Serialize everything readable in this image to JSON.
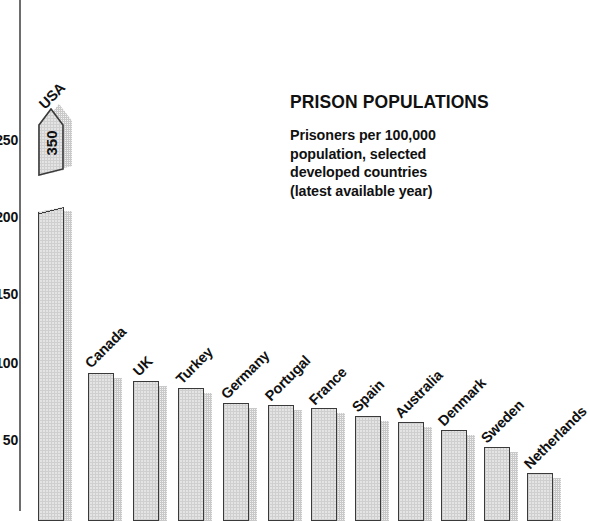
{
  "chart_data": {
    "type": "bar",
    "title": "PRISON POPULATIONS",
    "subtitle_lines": [
      "Prisoners per 100,000",
      "population, selected",
      "developed countries",
      "(latest available year)"
    ],
    "xlabel": "",
    "ylabel": "",
    "ylim": [
      0,
      260
    ],
    "grid": false,
    "legend": null,
    "y_ticks": [
      50,
      100,
      150,
      200,
      250
    ],
    "categories": [
      "USA",
      "Canada",
      "UK",
      "Turkey",
      "Germany",
      "Portugal",
      "France",
      "Spain",
      "Australia",
      "Denmark",
      "Sweden",
      "Netherlands"
    ],
    "values": [
      350,
      100,
      95,
      90,
      80,
      79,
      77,
      72,
      68,
      63,
      52,
      35
    ],
    "broken_axis_bar": {
      "category": "USA",
      "value": 350,
      "data_label": "350",
      "note": "bar is drawn broken with a pointed cap; true value exceeds axis maximum"
    },
    "style": {
      "bar_fill": "#e4e4e4",
      "bar_outline": "#3a3a3a",
      "bar_shadow": "#f2f2f2",
      "axis_color": "#6d6d6d",
      "text_color": "#111111",
      "background": "#ffffff"
    }
  },
  "axis": {
    "ticks": [
      {
        "label": "250",
        "y": 140
      },
      {
        "label": "200",
        "y": 217
      },
      {
        "label": "150",
        "y": 294
      },
      {
        "label": "100",
        "y": 363
      },
      {
        "label": "50",
        "y": 440
      }
    ]
  },
  "bars": [
    {
      "name": "USA",
      "label": "USA",
      "value": 350,
      "data_label": "350",
      "x": 38,
      "width": 26,
      "label_x": 47,
      "label_y": 96,
      "broken": true,
      "cap_top": 108,
      "cap_height": 68,
      "lower_top": 197
    },
    {
      "name": "Canada",
      "label": "Canada",
      "value": 100,
      "x": 88,
      "width": 26,
      "label_x": 93,
      "label_y": 355,
      "broken": false,
      "top": 363
    },
    {
      "name": "UK",
      "label": "UK",
      "value": 95,
      "x": 133,
      "width": 26,
      "label_x": 141,
      "label_y": 363,
      "broken": false,
      "top": 371
    },
    {
      "name": "Turkey",
      "label": "Turkey",
      "value": 90,
      "x": 178,
      "width": 26,
      "label_x": 184,
      "label_y": 371,
      "broken": false,
      "top": 378
    },
    {
      "name": "Germany",
      "label": "Germany",
      "value": 80,
      "x": 223,
      "width": 26,
      "label_x": 229,
      "label_y": 386,
      "broken": false,
      "top": 393
    },
    {
      "name": "Portugal",
      "label": "Portugal",
      "value": 79,
      "x": 268,
      "width": 26,
      "label_x": 273,
      "label_y": 388,
      "broken": false,
      "top": 395
    },
    {
      "name": "France",
      "label": "France",
      "value": 77,
      "x": 311,
      "width": 26,
      "label_x": 317,
      "label_y": 392,
      "broken": false,
      "top": 398
    },
    {
      "name": "Spain",
      "label": "Spain",
      "value": 72,
      "x": 355,
      "width": 26,
      "label_x": 360,
      "label_y": 399,
      "broken": false,
      "top": 406
    },
    {
      "name": "Australia",
      "label": "Australia",
      "value": 68,
      "x": 398,
      "width": 26,
      "label_x": 403,
      "label_y": 405,
      "broken": false,
      "top": 412
    },
    {
      "name": "Denmark",
      "label": "Denmark",
      "value": 63,
      "x": 441,
      "width": 26,
      "label_x": 446,
      "label_y": 413,
      "broken": false,
      "top": 420
    },
    {
      "name": "Sweden",
      "label": "Sweden",
      "value": 52,
      "x": 484,
      "width": 26,
      "label_x": 489,
      "label_y": 430,
      "broken": false,
      "top": 437
    },
    {
      "name": "Netherlands",
      "label": "Netherlands",
      "value": 35,
      "x": 527,
      "width": 26,
      "label_x": 532,
      "label_y": 456,
      "broken": false,
      "top": 463
    }
  ]
}
